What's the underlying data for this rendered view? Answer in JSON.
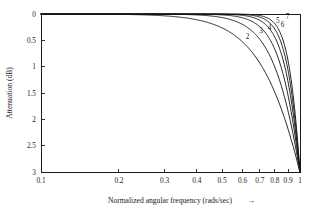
{
  "chart_data": {
    "type": "line",
    "title": "",
    "xlabel": "Normalized angular frequency (rads/sec)",
    "xlabel_arrow": "→",
    "ylabel": "Attenuation (dB)",
    "xscale": "log",
    "yscale": "linear",
    "y_inverted": true,
    "xlim": [
      0.1,
      1.0
    ],
    "ylim": [
      0,
      3
    ],
    "grid": false,
    "legend_position": "inline-curve-labels",
    "xticks": [
      0.1,
      0.2,
      0.3,
      0.4,
      0.5,
      0.6,
      0.7,
      0.8,
      0.9,
      1.0
    ],
    "xticklabels": [
      "0.1",
      "0.2",
      "0.3",
      "0.4",
      "0.5",
      "0.6",
      "0.7",
      "0.8",
      "0.9",
      "1"
    ],
    "yticks": [
      0,
      0.5,
      1,
      1.5,
      2,
      2.5,
      3
    ],
    "yticklabels": [
      "0",
      "0.5",
      "1",
      "1.5",
      "2",
      "2.5",
      "3"
    ],
    "formula": "A = 10*log10(1 + w^(2n))",
    "series": [
      {
        "name": "2",
        "order": 2,
        "label": "2",
        "label_x": 0.627,
        "label_y": 0.47,
        "x": [
          0.1,
          0.15,
          0.2,
          0.25,
          0.3,
          0.35,
          0.4,
          0.45,
          0.5,
          0.55,
          0.6,
          0.65,
          0.7,
          0.75,
          0.8,
          0.85,
          0.9,
          0.95,
          1.0
        ],
        "y": [
          0.0004,
          0.0022,
          0.0069,
          0.0169,
          0.0351,
          0.065,
          0.1103,
          0.175,
          0.2633,
          0.3793,
          0.5268,
          0.7085,
          0.9265,
          1.1811,
          1.4713,
          1.7948,
          2.1478,
          2.5254,
          3.0103
        ]
      },
      {
        "name": "3",
        "order": 3,
        "label": "3",
        "label_x": 0.707,
        "label_y": 0.36,
        "x": [
          0.1,
          0.15,
          0.2,
          0.25,
          0.3,
          0.35,
          0.4,
          0.45,
          0.5,
          0.55,
          0.6,
          0.65,
          0.7,
          0.75,
          0.8,
          0.85,
          0.9,
          0.95,
          1.0
        ],
        "y": [
          0.0,
          0.0,
          0.0003,
          0.0011,
          0.0032,
          0.0079,
          0.0177,
          0.0356,
          0.0661,
          0.1145,
          0.1875,
          0.2924,
          0.4374,
          0.6309,
          0.8806,
          1.193,
          1.5723,
          2.0196,
          3.0103
        ]
      },
      {
        "name": "4",
        "order": 4,
        "label": "4",
        "label_x": 0.763,
        "label_y": 0.3,
        "x": [
          0.1,
          0.2,
          0.25,
          0.3,
          0.35,
          0.4,
          0.45,
          0.5,
          0.55,
          0.6,
          0.65,
          0.7,
          0.75,
          0.8,
          0.85,
          0.9,
          0.95,
          1.0
        ],
        "y": [
          0.0,
          0.0,
          0.0001,
          0.0003,
          0.001,
          0.0028,
          0.0072,
          0.0166,
          0.0346,
          0.0665,
          0.1192,
          0.2016,
          0.3244,
          0.4999,
          0.7419,
          1.0643,
          1.4828,
          3.0103
        ]
      },
      {
        "name": "5",
        "order": 5,
        "label": "5",
        "label_x": 0.82,
        "label_y": 0.17,
        "x": [
          0.1,
          0.2,
          0.3,
          0.35,
          0.4,
          0.45,
          0.5,
          0.55,
          0.6,
          0.65,
          0.7,
          0.75,
          0.8,
          0.85,
          0.9,
          0.95,
          1.0
        ],
        "y": [
          0.0,
          0.0,
          0.0,
          0.0001,
          0.0004,
          0.0015,
          0.0042,
          0.0105,
          0.0237,
          0.049,
          0.0941,
          0.1696,
          0.2888,
          0.4676,
          0.7227,
          1.0728,
          3.0103
        ]
      },
      {
        "name": "6",
        "order": 6,
        "label": "6",
        "label_x": 0.856,
        "label_y": 0.25,
        "x": [
          0.1,
          0.2,
          0.3,
          0.4,
          0.45,
          0.5,
          0.55,
          0.6,
          0.65,
          0.7,
          0.75,
          0.8,
          0.85,
          0.9,
          0.95,
          1.0
        ],
        "y": [
          0.0,
          0.0,
          0.0,
          0.0001,
          0.0003,
          0.0011,
          0.0032,
          0.0085,
          0.0202,
          0.0441,
          0.089,
          0.1681,
          0.2996,
          0.5064,
          0.8176,
          3.0103
        ]
      },
      {
        "name": "7",
        "order": 7,
        "label": "7",
        "label_x": 0.896,
        "label_y": 0.1,
        "x": [
          0.1,
          0.2,
          0.3,
          0.4,
          0.5,
          0.55,
          0.6,
          0.65,
          0.7,
          0.75,
          0.8,
          0.85,
          0.9,
          0.95,
          1.0
        ],
        "y": [
          0.0,
          0.0,
          0.0,
          0.0,
          0.0003,
          0.0009,
          0.0031,
          0.0083,
          0.0207,
          0.0467,
          0.0977,
          0.1916,
          0.3549,
          0.6253,
          3.0103
        ]
      }
    ]
  }
}
